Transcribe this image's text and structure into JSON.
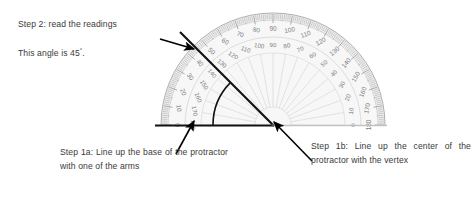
{
  "document": {
    "title": "Protractor angle measurement instructions"
  },
  "annotations": {
    "step2_heading": "Step 2: read the readings",
    "angle_statement_prefix": "This angle is 45",
    "angle_statement_degree": "°",
    "angle_statement_suffix": ".",
    "step1a_text": "Step 1a: Line up the base of the protractor with one of the arms",
    "step1b_text": "Step 1b: Line up the center of the protractor with the vertex"
  },
  "figure": {
    "type": "protractor-diagram",
    "measured_angle_degrees": 45,
    "center_x": 273,
    "center_y": 125,
    "outer_radius": 112,
    "inner_scale_radius": 88,
    "arc_radius": 60,
    "baseline_start_x": 155,
    "baseline_end_x": 387,
    "arm_end_x": 180,
    "arm_end_y": 32,
    "colors": {
      "body_fill": "#efefef",
      "rim": "#b9b9b9",
      "tick": "#9a9a9a",
      "label": "#7d7d7d",
      "arm": "#111111",
      "arrow": "#000000",
      "text": "#3a3a3a"
    },
    "outer_scale_labels": [
      0,
      10,
      20,
      30,
      40,
      50,
      60,
      70,
      80,
      90,
      100,
      110,
      120,
      130,
      140,
      150,
      160,
      170,
      180
    ],
    "inner_scale_labels": [
      180,
      170,
      160,
      150,
      140,
      130,
      120,
      110,
      100,
      90,
      80,
      70,
      60,
      50,
      40,
      30,
      20,
      10,
      0
    ],
    "arrows": [
      {
        "name": "arrow-to-arm",
        "x1": 160,
        "y1": 39,
        "x2": 194,
        "y2": 49
      },
      {
        "name": "arrow-to-baseline",
        "x1": 176,
        "y1": 154,
        "x2": 194,
        "y2": 121
      },
      {
        "name": "arrow-to-vertex",
        "x1": 312,
        "y1": 161,
        "x2": 273,
        "y2": 122
      }
    ]
  }
}
